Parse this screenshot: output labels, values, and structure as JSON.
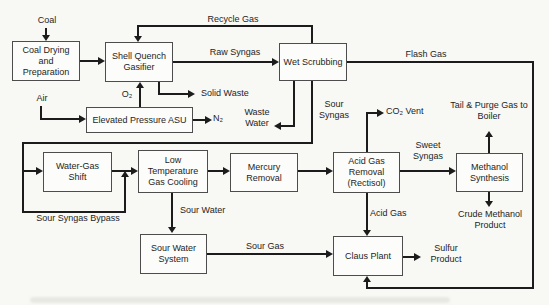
{
  "diagram": {
    "type": "process-flow-diagram",
    "colors": {
      "background": "#f8f8f5",
      "line": "#1c1c1c",
      "box_border": "#4d4d4d",
      "box_fill": "#fcfcfa",
      "text": "#1e1e1e"
    },
    "nodes": [
      {
        "id": "coal-drying",
        "label": "Coal Drying and Preparation"
      },
      {
        "id": "gasifier",
        "label": "Shell Quench Gasifier"
      },
      {
        "id": "wet-scrubbing",
        "label": "Wet Scrubbing"
      },
      {
        "id": "asu",
        "label": "Elevated Pressure ASU"
      },
      {
        "id": "water-gas-shift",
        "label": "Water-Gas Shift"
      },
      {
        "id": "ltgc",
        "label": "Low Temperature Gas Cooling"
      },
      {
        "id": "mercury-removal",
        "label": "Mercury Removal"
      },
      {
        "id": "acid-gas-removal",
        "label": "Acid Gas Removal (Rectisol)"
      },
      {
        "id": "methanol-synthesis",
        "label": "Methanol Synthesis"
      },
      {
        "id": "sour-water-system",
        "label": "Sour Water System"
      },
      {
        "id": "claus-plant",
        "label": "Claus Plant"
      }
    ],
    "streams": {
      "coal": "Coal",
      "recycle_gas": "Recycle Gas",
      "raw_syngas": "Raw Syngas",
      "flash_gas": "Flash Gas",
      "solid_waste": "Solid Waste",
      "o2": "O₂",
      "air": "Air",
      "n2": "N₂",
      "waste_water": "Waste Water",
      "sour_syngas": "Sour Syngas",
      "co2_vent": "CO₂ Vent",
      "tail_purge": "Tail & Purge Gas to Boiler",
      "sweet_syngas": "Sweet Syngas",
      "sour_syngas_bypass": "Sour Syngas Bypass",
      "sour_water": "Sour Water",
      "sour_gas": "Sour Gas",
      "acid_gas": "Acid Gas",
      "sulfur_product": "Sulfur Product",
      "crude_methanol": "Crude Methanol Product"
    },
    "edges": [
      {
        "from": "Coal",
        "to": "Coal Drying and Preparation",
        "label": "Coal"
      },
      {
        "from": "Coal Drying and Preparation",
        "to": "Shell Quench Gasifier",
        "label": ""
      },
      {
        "from": "Wet Scrubbing",
        "to": "Shell Quench Gasifier",
        "label": "Recycle Gas"
      },
      {
        "from": "Shell Quench Gasifier",
        "to": "Wet Scrubbing",
        "label": "Raw Syngas"
      },
      {
        "from": "Shell Quench Gasifier",
        "to": "Solid Waste",
        "label": "Solid Waste"
      },
      {
        "from": "Elevated Pressure ASU",
        "to": "Shell Quench Gasifier",
        "label": "O₂"
      },
      {
        "from": "Air",
        "to": "Elevated Pressure ASU",
        "label": "Air"
      },
      {
        "from": "Elevated Pressure ASU",
        "to": "N₂",
        "label": "N₂"
      },
      {
        "from": "Wet Scrubbing",
        "to": "Waste Water",
        "label": "Waste Water"
      },
      {
        "from": "Wet Scrubbing",
        "to": "Water-Gas Shift",
        "label": "Sour Syngas"
      },
      {
        "from": "Sour Syngas line",
        "to": "Low Temperature Gas Cooling",
        "label": "Sour Syngas Bypass"
      },
      {
        "from": "Water-Gas Shift",
        "to": "Low Temperature Gas Cooling",
        "label": ""
      },
      {
        "from": "Low Temperature Gas Cooling",
        "to": "Mercury Removal",
        "label": ""
      },
      {
        "from": "Mercury Removal",
        "to": "Acid Gas Removal (Rectisol)",
        "label": ""
      },
      {
        "from": "Acid Gas Removal (Rectisol)",
        "to": "CO₂ Vent",
        "label": "CO₂ Vent"
      },
      {
        "from": "Acid Gas Removal (Rectisol)",
        "to": "Methanol Synthesis",
        "label": "Sweet Syngas"
      },
      {
        "from": "Methanol Synthesis",
        "to": "Tail & Purge Gas to Boiler",
        "label": "Tail & Purge Gas to Boiler"
      },
      {
        "from": "Methanol Synthesis",
        "to": "Crude Methanol Product",
        "label": "Crude Methanol Product"
      },
      {
        "from": "Low Temperature Gas Cooling",
        "to": "Sour Water System",
        "label": "Sour Water"
      },
      {
        "from": "Sour Water System",
        "to": "Claus Plant",
        "label": "Sour Gas"
      },
      {
        "from": "Acid Gas Removal (Rectisol)",
        "to": "Claus Plant",
        "label": "Acid Gas"
      },
      {
        "from": "Wet Scrubbing",
        "to": "Claus Plant",
        "label": "Flash Gas"
      },
      {
        "from": "Claus Plant",
        "to": "Sulfur Product",
        "label": "Sulfur Product"
      }
    ]
  }
}
